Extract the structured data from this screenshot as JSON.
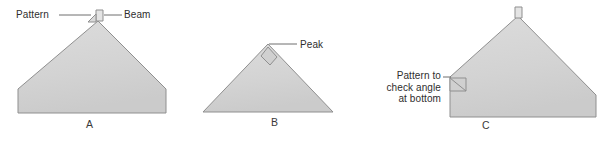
{
  "figure": {
    "background_color": "#ffffff",
    "fill_color": "#d4d4d4",
    "stroke_color": "#8a8a8a",
    "text_color": "#2e2e2e",
    "width": 612,
    "height": 143
  },
  "panels": [
    {
      "id": "a",
      "caption": "A",
      "shape": "pentagon-house",
      "labels": [
        {
          "key": "pattern",
          "text": "Pattern",
          "points_to": "apex-left-pattern-piece"
        },
        {
          "key": "beam",
          "text": "Beam",
          "points_to": "apex-slot"
        }
      ]
    },
    {
      "id": "b",
      "caption": "B",
      "shape": "triangle",
      "labels": [
        {
          "key": "peak",
          "text": "Peak",
          "points_to": "apex"
        }
      ]
    },
    {
      "id": "c",
      "caption": "C",
      "shape": "pentagon-asymmetric",
      "labels": [
        {
          "key": "pattern_bottom",
          "line1": "Pattern to",
          "line2": "check angle",
          "line3": "at bottom",
          "points_to": "bottom-left-angle-pattern"
        }
      ]
    }
  ]
}
